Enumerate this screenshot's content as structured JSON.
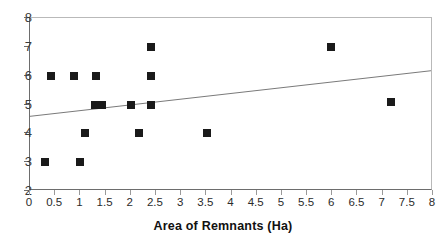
{
  "chart_data": {
    "type": "scatter",
    "title": "",
    "xlabel": "Area of Remnants (Ha)",
    "ylabel": "",
    "xlim": [
      0,
      8
    ],
    "ylim": [
      2,
      8
    ],
    "grid": false,
    "legend": null,
    "x_ticks": [
      "0",
      "0.5",
      "1",
      "1.5",
      "2",
      "2.5",
      "3",
      "3.5",
      "4",
      "4.5",
      "5",
      "5.5",
      "6",
      "6.5",
      "7",
      "7.5",
      "8"
    ],
    "x_tick_values": [
      0,
      0.5,
      1,
      1.5,
      2,
      2.5,
      3,
      3.5,
      4,
      4.5,
      5,
      5.5,
      6,
      6.5,
      7,
      7.5,
      8
    ],
    "y_ticks": [
      "2",
      "3",
      "4",
      "5",
      "6",
      "7",
      "8"
    ],
    "y_tick_values": [
      2,
      3,
      4,
      5,
      6,
      7,
      8
    ],
    "marker_color": "#1a1a1a",
    "marker_shape": "square",
    "points": [
      {
        "x": 0.3,
        "y": 3
      },
      {
        "x": 0.42,
        "y": 6
      },
      {
        "x": 0.87,
        "y": 6
      },
      {
        "x": 1.0,
        "y": 3
      },
      {
        "x": 1.1,
        "y": 4
      },
      {
        "x": 1.31,
        "y": 6
      },
      {
        "x": 1.3,
        "y": 5
      },
      {
        "x": 1.42,
        "y": 5
      },
      {
        "x": 2.0,
        "y": 5
      },
      {
        "x": 2.16,
        "y": 4
      },
      {
        "x": 2.4,
        "y": 7
      },
      {
        "x": 2.4,
        "y": 6
      },
      {
        "x": 2.4,
        "y": 5
      },
      {
        "x": 3.51,
        "y": 4
      },
      {
        "x": 5.97,
        "y": 7
      },
      {
        "x": 7.16,
        "y": 5.1
      }
    ],
    "trendline": {
      "x0": 0,
      "y0": 4.55,
      "x1": 8,
      "y1": 6.15,
      "color": "#7a7a7a"
    }
  }
}
